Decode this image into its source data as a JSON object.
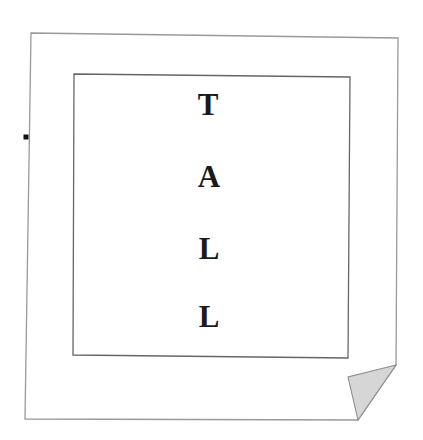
{
  "canvas": {
    "width": 423,
    "height": 440,
    "background_color": "#ffffff"
  },
  "document_page": {
    "name": "paper-sheet",
    "description": "A slightly skewed white sheet of paper with a folded bottom-right corner",
    "fill_color": "#ffffff",
    "border_color": "#9a9a9a",
    "border_width": 1.3,
    "outline_points": "31,33 398,38 396,365 358,420 25,419",
    "corner_fold": {
      "name": "page-corner-fold",
      "fill_color": "#d6d6d6",
      "border_color": "#8d8d8d",
      "points": "396,365 348,377 358,420"
    }
  },
  "inner_frame": {
    "name": "inner-border-box",
    "fill_color": "#ffffff",
    "border_color": "#666666",
    "border_width": 1.3,
    "outline_points": "74,74 350,77 348,358 73,355"
  },
  "marker_dot": {
    "name": "left-edge-marker-dot",
    "color": "#111111",
    "x": 26,
    "y": 137,
    "size": 5
  },
  "word": {
    "text": "TALL",
    "orientation": "vertical",
    "color": "#1a1a1a",
    "font_size_px": 31,
    "letters": [
      {
        "char": "T",
        "x": 208,
        "y": 108
      },
      {
        "char": "A",
        "x": 209,
        "y": 180
      },
      {
        "char": "L",
        "x": 209,
        "y": 252
      },
      {
        "char": "L",
        "x": 209,
        "y": 320
      }
    ]
  }
}
